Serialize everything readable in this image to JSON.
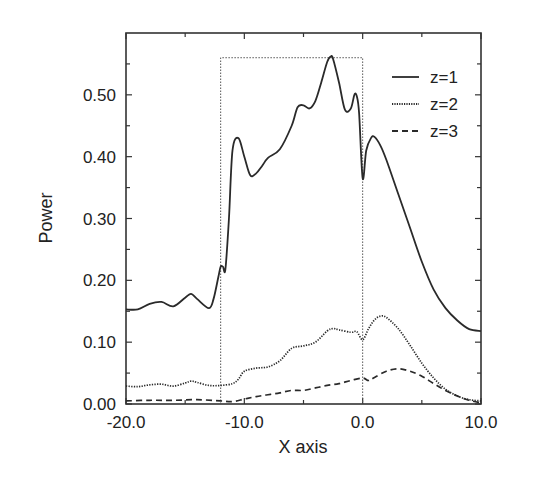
{
  "chart_data": {
    "type": "line",
    "title": "",
    "xlabel": "X axis",
    "ylabel": "Power",
    "xlim": [
      -20.0,
      10.0
    ],
    "ylim": [
      0.0,
      0.6
    ],
    "xticks": [
      -20.0,
      -10.0,
      0.0,
      10.0
    ],
    "xtick_labels": [
      "-20.0",
      "-10.0",
      "0.0",
      "10.0"
    ],
    "yticks": [
      0.0,
      0.1,
      0.2,
      0.3,
      0.4,
      0.5
    ],
    "ytick_labels": [
      "0.00",
      "0.10",
      "0.20",
      "0.30",
      "0.40",
      "0.50"
    ],
    "grid": false,
    "legend_position": "upper right",
    "annotations": [
      {
        "type": "dotted-rectangle",
        "x0": -12.0,
        "x1": 0.0,
        "y0": 0.0,
        "y1": 0.56
      }
    ],
    "series": [
      {
        "name": "z=1",
        "style": "solid",
        "x": [
          -20,
          -19,
          -18,
          -17,
          -16,
          -15,
          -14.5,
          -14,
          -13,
          -12.6,
          -12.2,
          -12,
          -11.8,
          -11.6,
          -11.3,
          -11,
          -10.5,
          -10,
          -9.5,
          -9,
          -8.5,
          -8,
          -7,
          -6,
          -5.5,
          -5,
          -4.5,
          -4,
          -3.5,
          -3,
          -2.7,
          -2.5,
          -2,
          -1.5,
          -1,
          -0.7,
          -0.5,
          -0.3,
          0,
          0.3,
          0.7,
          1,
          1.5,
          2,
          3,
          4,
          5,
          6,
          7,
          8,
          9,
          10
        ],
        "y": [
          0.153,
          0.153,
          0.162,
          0.165,
          0.158,
          0.172,
          0.178,
          0.17,
          0.155,
          0.17,
          0.205,
          0.222,
          0.222,
          0.218,
          0.3,
          0.41,
          0.43,
          0.4,
          0.37,
          0.373,
          0.385,
          0.398,
          0.412,
          0.45,
          0.48,
          0.483,
          0.478,
          0.49,
          0.52,
          0.553,
          0.562,
          0.558,
          0.52,
          0.476,
          0.478,
          0.5,
          0.498,
          0.47,
          0.365,
          0.41,
          0.43,
          0.432,
          0.418,
          0.395,
          0.34,
          0.285,
          0.23,
          0.185,
          0.155,
          0.135,
          0.121,
          0.118
        ]
      },
      {
        "name": "z=2",
        "style": "dotted",
        "x": [
          -20,
          -19,
          -18,
          -17,
          -16,
          -15,
          -14.5,
          -14,
          -13,
          -12,
          -11,
          -10.5,
          -10,
          -9,
          -8,
          -7,
          -6,
          -5,
          -4,
          -3,
          -2.5,
          -2,
          -1,
          -0.5,
          0,
          0.5,
          1,
          1.5,
          2,
          3,
          4,
          5,
          6,
          7,
          8,
          9,
          10
        ],
        "y": [
          0.029,
          0.028,
          0.031,
          0.032,
          0.029,
          0.034,
          0.037,
          0.035,
          0.03,
          0.03,
          0.033,
          0.04,
          0.053,
          0.058,
          0.06,
          0.07,
          0.09,
          0.094,
          0.1,
          0.118,
          0.122,
          0.12,
          0.116,
          0.117,
          0.104,
          0.122,
          0.136,
          0.142,
          0.14,
          0.122,
          0.095,
          0.066,
          0.042,
          0.024,
          0.013,
          0.007,
          0.005
        ]
      },
      {
        "name": "z=3",
        "style": "dashed",
        "x": [
          -20,
          -18,
          -16,
          -14,
          -12,
          -11,
          -10,
          -9,
          -8,
          -7,
          -6,
          -5,
          -4,
          -3,
          -2,
          -1,
          0,
          0.5,
          1,
          2,
          3,
          4,
          5,
          6,
          7,
          8,
          9,
          10
        ],
        "y": [
          0.005,
          0.006,
          0.006,
          0.007,
          0.005,
          0.004,
          0.008,
          0.012,
          0.015,
          0.018,
          0.022,
          0.022,
          0.026,
          0.03,
          0.033,
          0.038,
          0.042,
          0.038,
          0.043,
          0.053,
          0.057,
          0.053,
          0.045,
          0.033,
          0.022,
          0.013,
          0.006,
          0.002
        ]
      }
    ]
  },
  "legend": {
    "items": [
      {
        "label": "z=1",
        "style": "solid"
      },
      {
        "label": "z=2",
        "style": "dotted"
      },
      {
        "label": "z=3",
        "style": "dashed"
      }
    ]
  },
  "colors": {
    "line": "#2a2a2a",
    "axis": "#333333",
    "text": "#222222",
    "background": "#ffffff"
  }
}
